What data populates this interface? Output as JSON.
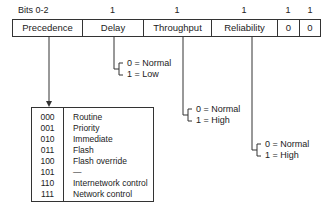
{
  "bit_labels": [
    "Bits 0-2",
    "1",
    "1",
    "1",
    "1",
    "1"
  ],
  "fields": [
    "Precedence",
    "Delay",
    "Throughput",
    "Reliability",
    "0",
    "0"
  ],
  "precedence_table": {
    "codes": [
      "000",
      "001",
      "010",
      "011",
      "100",
      "101",
      "110",
      "111"
    ],
    "names": [
      "Routine",
      "Priority",
      "Immediate",
      "Flash",
      "Flash override",
      "—",
      "Internetwork control",
      "Network control"
    ]
  },
  "delay_options": [
    "0 = Normal",
    "1 = Low"
  ],
  "throughput_options": [
    "0 = Normal",
    "1 = High"
  ],
  "reliability_options": [
    "0 = Normal",
    "1 = High"
  ]
}
